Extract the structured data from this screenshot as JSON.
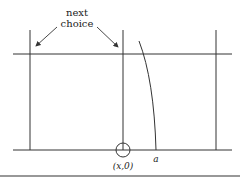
{
  "diagram": {
    "annotation": {
      "line1": "next",
      "line2": "choice"
    },
    "point_label": "(x,0)",
    "curve_label": "a",
    "colors": {
      "stroke": "#333333",
      "background": "#ffffff"
    }
  }
}
